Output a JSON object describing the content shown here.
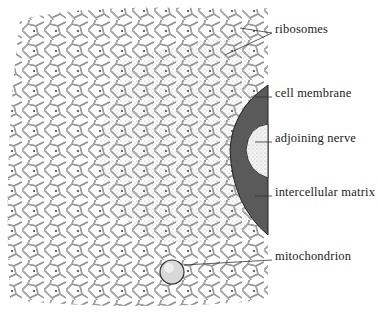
{
  "diagram": {
    "type": "biological-illustration",
    "labels": [
      {
        "id": "ribosomes",
        "text": "ribosomes",
        "x": 275,
        "y": 29
      },
      {
        "id": "cell-membrane",
        "text": "cell membrane",
        "x": 275,
        "y": 93
      },
      {
        "id": "adjoining-nerve",
        "text": "adjoining nerve",
        "x": 275,
        "y": 138
      },
      {
        "id": "intercellular-matrix",
        "text": "intercellular matrix",
        "x": 275,
        "y": 192
      },
      {
        "id": "mitochondrion",
        "text": "mitochondrion",
        "x": 275,
        "y": 256
      }
    ],
    "colors": {
      "ink": "#333333",
      "matrix_dark": "#5a5a5a",
      "stipple": "#c8c8c8",
      "nerve": "#f2f2f2",
      "background": "#ffffff"
    }
  }
}
